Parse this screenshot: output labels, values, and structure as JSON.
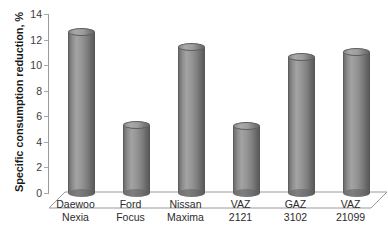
{
  "chart_data": {
    "type": "bar",
    "title": "",
    "subtitle": "",
    "xlabel": "",
    "ylabel": "Specific consumption reduction, %",
    "categories": [
      "Daewoo Nexia",
      "Ford Focus",
      "Nissan Maxima",
      "VAZ 2121",
      "GAZ 3102",
      "VAZ 21099"
    ],
    "category_lines": [
      [
        "Daewoo",
        "Nexia"
      ],
      [
        "Ford",
        "Focus"
      ],
      [
        "Nissan",
        "Maxima"
      ],
      [
        "VAZ",
        "2121"
      ],
      [
        "GAZ",
        "3102"
      ],
      [
        "VAZ",
        "21099"
      ]
    ],
    "values": [
      12.4,
      5.2,
      11.3,
      5.1,
      10.5,
      10.9
    ],
    "ylim": [
      0,
      14
    ],
    "ytick_step": 2,
    "yticks": [
      0,
      2,
      4,
      6,
      8,
      10,
      12,
      14
    ],
    "ytick_labels": [
      "0",
      "2",
      "4",
      "6",
      "8",
      "10",
      "12",
      "14"
    ],
    "grid": false,
    "legend": false,
    "legend_position": "none",
    "style": "3d-cylinder",
    "bar_color": "#8d8d8d",
    "axis_color": "#9a9a9a",
    "text_color": "#2b2b2b",
    "background": "#ffffff",
    "annotations": []
  }
}
